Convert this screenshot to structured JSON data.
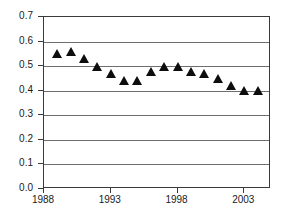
{
  "chart_data": {
    "type": "scatter",
    "title": "",
    "subtitle": "",
    "xlabel": "",
    "ylabel": "",
    "xlim": [
      1988,
      2005
    ],
    "ylim": [
      0.0,
      0.7
    ],
    "grid": true,
    "legend": null,
    "marker_style": "filled-triangle",
    "marker_color": "#0d0d0d",
    "y_ticks": [
      "0.0",
      "0.1",
      "0.2",
      "0.3",
      "0.4",
      "0.5",
      "0.6",
      "0.7"
    ],
    "y_tick_values": [
      0.0,
      0.1,
      0.2,
      0.3,
      0.4,
      0.5,
      0.6,
      0.7
    ],
    "x_ticks": [
      "1988",
      "1993",
      "1998",
      "2003"
    ],
    "x_tick_values": [
      1988,
      1993,
      1998,
      2003
    ],
    "x": [
      1989,
      1990,
      1991,
      1992,
      1993,
      1994,
      1995,
      1996,
      1997,
      1998,
      1999,
      2000,
      2001,
      2002,
      2003,
      2004
    ],
    "values": [
      0.55,
      0.56,
      0.53,
      0.5,
      0.47,
      0.44,
      0.44,
      0.48,
      0.5,
      0.5,
      0.48,
      0.47,
      0.45,
      0.42,
      0.4,
      0.4
    ],
    "points": [
      {
        "x": 1989,
        "y": 0.55
      },
      {
        "x": 1990,
        "y": 0.56
      },
      {
        "x": 1991,
        "y": 0.53
      },
      {
        "x": 1992,
        "y": 0.5
      },
      {
        "x": 1993,
        "y": 0.47
      },
      {
        "x": 1994,
        "y": 0.44
      },
      {
        "x": 1995,
        "y": 0.44
      },
      {
        "x": 1996,
        "y": 0.48
      },
      {
        "x": 1997,
        "y": 0.5
      },
      {
        "x": 1998,
        "y": 0.5
      },
      {
        "x": 1999,
        "y": 0.48
      },
      {
        "x": 2000,
        "y": 0.47
      },
      {
        "x": 2001,
        "y": 0.45
      },
      {
        "x": 2002,
        "y": 0.42
      },
      {
        "x": 2003,
        "y": 0.4
      },
      {
        "x": 2004,
        "y": 0.4
      }
    ]
  },
  "colors": {
    "marker": "#0d0d0d",
    "gridline": "#6e6e6e",
    "frame": "#3a3a3a",
    "text": "#1a1a1a",
    "background": "#ffffff"
  }
}
